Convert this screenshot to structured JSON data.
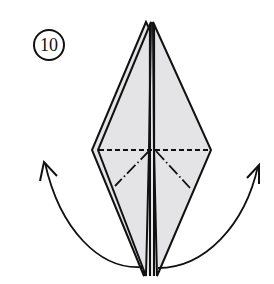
{
  "step": {
    "number": "10"
  },
  "colors": {
    "paper_fill": "#e4e4e6",
    "line": "#111111",
    "background": "#ffffff"
  },
  "diagram": {
    "folds": [
      {
        "type": "valley",
        "style": "dashed",
        "orientation": "horizontal"
      },
      {
        "type": "mountain",
        "style": "dash-dot",
        "side": "left"
      },
      {
        "type": "mountain",
        "style": "dash-dot",
        "side": "right"
      }
    ],
    "arrows": [
      {
        "name": "left-flap-arrow",
        "direction": "up-left"
      },
      {
        "name": "right-flap-arrow",
        "direction": "up-right"
      }
    ]
  }
}
